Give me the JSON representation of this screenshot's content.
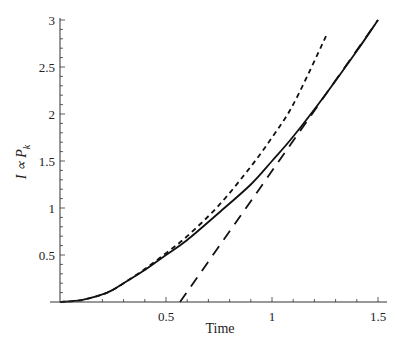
{
  "chart_data": {
    "type": "line",
    "title": "",
    "xlabel": "Time",
    "ylabel": "I ∝ P_k",
    "xlim": [
      0,
      1.55
    ],
    "ylim": [
      0,
      3
    ],
    "grid": false,
    "legend": null,
    "x_ticks": [
      0.5,
      1,
      1.5
    ],
    "x_tick_labels": [
      "0.5",
      "1",
      "1.5"
    ],
    "y_ticks": [
      0.5,
      1,
      1.5,
      2,
      2.5,
      3
    ],
    "y_tick_labels": [
      "0.5",
      "1",
      "1.5",
      "2",
      "2.5",
      "3"
    ],
    "series": [
      {
        "name": "solid",
        "style": "solid",
        "x": [
          0,
          0.1,
          0.2,
          0.25,
          0.3,
          0.4,
          0.5,
          0.6,
          0.75,
          0.9,
          1.0,
          1.1,
          1.25,
          1.4,
          1.5
        ],
        "y": [
          0,
          0.02,
          0.08,
          0.13,
          0.2,
          0.34,
          0.5,
          0.66,
          0.95,
          1.25,
          1.5,
          1.76,
          2.2,
          2.67,
          3.0
        ]
      },
      {
        "name": "short-dashed",
        "style": "short-dash",
        "x": [
          0,
          0.1,
          0.2,
          0.25,
          0.3,
          0.4,
          0.5,
          0.6,
          0.75,
          0.9,
          1.0,
          1.085,
          1.17,
          1.255
        ],
        "y": [
          0,
          0.02,
          0.08,
          0.13,
          0.2,
          0.35,
          0.52,
          0.7,
          1.03,
          1.44,
          1.75,
          2.04,
          2.42,
          2.83
        ]
      },
      {
        "name": "long-dashed",
        "style": "long-dash",
        "x": [
          0.566,
          1.5
        ],
        "y": [
          0,
          3.0
        ]
      }
    ]
  },
  "axes": {
    "xlabel": "Time",
    "ylabel_main": "I ∝ P",
    "ylabel_sub": "k"
  }
}
